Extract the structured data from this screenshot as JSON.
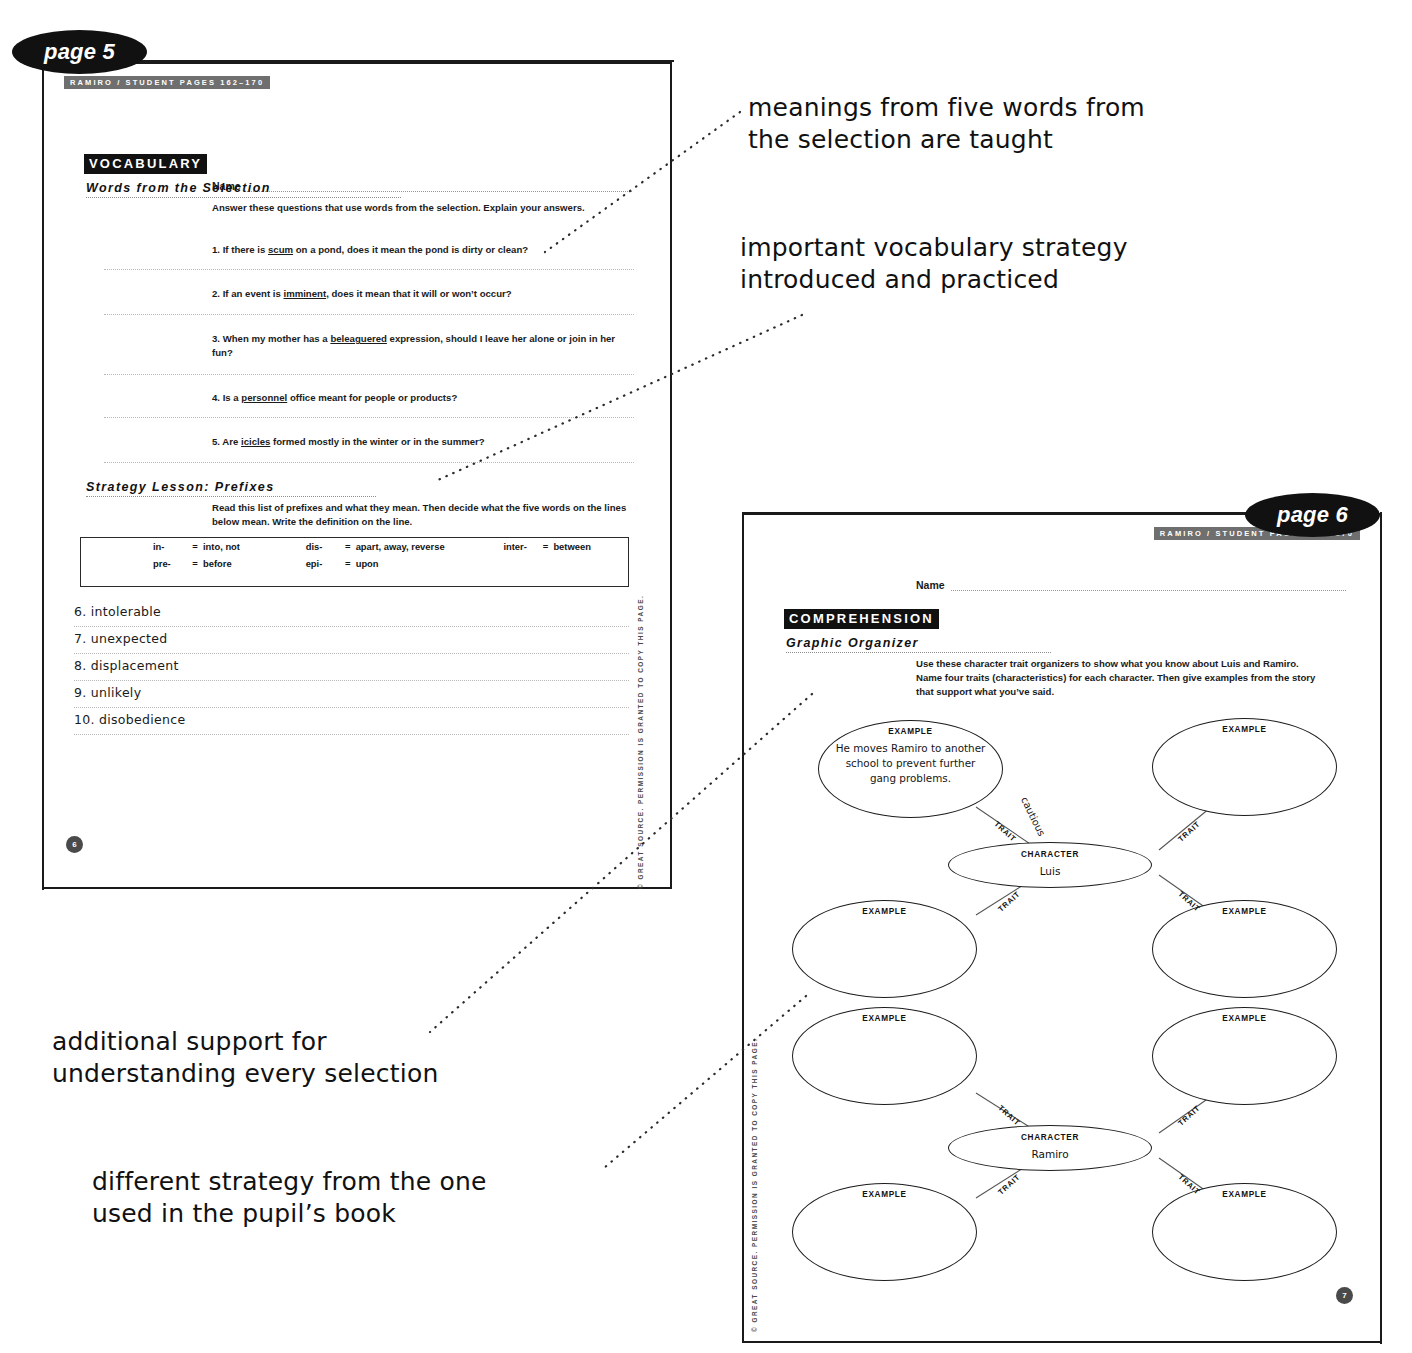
{
  "page5": {
    "tab_label": "page 5",
    "running_head": "RAMIRO / STUDENT PAGES 162–170",
    "name_label": "Name",
    "vocabulary_banner": "VOCABULARY",
    "words_subhead": "Words from the Selection",
    "words_instruction": "Answer these questions that use words from the selection. Explain your answers.",
    "questions": [
      {
        "num": "1.",
        "before": "If there is ",
        "word": "scum",
        "after": " on a pond, does it mean the pond is dirty or clean?"
      },
      {
        "num": "2.",
        "before": "If an event is ",
        "word": "imminent",
        "after": ", does it mean that it will or won’t occur?"
      },
      {
        "num": "3.",
        "before": "When my mother has a ",
        "word": "beleaguered",
        "after": " expression, should I leave her alone or join in her fun?"
      },
      {
        "num": "4.",
        "before": "Is a ",
        "word": "personnel",
        "after": " office meant for people or products?"
      },
      {
        "num": "5.",
        "before": "Are ",
        "word": "icicles",
        "after": " formed mostly in the winter or in the summer?"
      }
    ],
    "strategy_subhead": "Strategy Lesson: Prefixes",
    "strategy_instruction": "Read this list of prefixes and what they mean. Then decide what the five words on the lines below mean. Write the definition on the line.",
    "prefix_table": [
      [
        {
          "prefix": "in-",
          "eq": "=",
          "meaning": "into, not"
        },
        {
          "prefix": "dis-",
          "eq": "=",
          "meaning": "apart, away, reverse"
        },
        {
          "prefix": "inter-",
          "eq": "=",
          "meaning": "between"
        }
      ],
      [
        {
          "prefix": "pre-",
          "eq": "=",
          "meaning": "before"
        },
        {
          "prefix": "epi-",
          "eq": "=",
          "meaning": "upon"
        },
        {
          "prefix": "",
          "eq": "",
          "meaning": ""
        }
      ]
    ],
    "handwritten_words": [
      "6. intolerable",
      "7. unexpected",
      "8. displacement",
      "9. unlikely",
      "10. disobedience"
    ],
    "copyright": "© GREAT SOURCE. PERMISSION IS GRANTED TO COPY THIS PAGE.",
    "page_number": "6"
  },
  "page6": {
    "tab_label": "page 6",
    "running_head": "RAMIRO / STUDENT PAGES 162–170",
    "name_label": "Name",
    "comprehension_banner": "COMPREHENSION",
    "organizer_subhead": "Graphic Organizer",
    "organizer_instruction": "Use these character trait organizers to show what you know about Luis and Ramiro. Name four traits (characteristics) for each character. Then give examples from the story that support what you’ve said.",
    "copyright": "© GREAT SOURCE. PERMISSION IS GRANTED TO COPY THIS PAGE.",
    "page_number": "7",
    "organizers": [
      {
        "character_label": "CHARACTER",
        "character_name": "Luis",
        "trait_label": "TRAIT",
        "example_label": "EXAMPLE",
        "filled_trait": "cautious",
        "filled_example": "He moves Ramiro to another school to prevent further gang problems."
      },
      {
        "character_label": "CHARACTER",
        "character_name": "Ramiro",
        "trait_label": "TRAIT",
        "example_label": "EXAMPLE",
        "filled_trait": "",
        "filled_example": ""
      }
    ]
  },
  "callouts": [
    {
      "id": "callout-vocab-words",
      "text": "meanings from five words from\nthe selection are taught"
    },
    {
      "id": "callout-vocab-strategy",
      "text": "important vocabulary strategy\nintroduced and practiced"
    },
    {
      "id": "callout-support",
      "text": "additional support for\nunderstanding every selection"
    },
    {
      "id": "callout-strategy-diff",
      "text": "different strategy from the one\nused in the pupil’s book"
    }
  ],
  "colors": {
    "ink": "#111111",
    "rule": "#b9b9b9",
    "runhead_bg": "#6f6f6f",
    "banner_bg": "#111111",
    "pagenum_bg": "#4a4a4a"
  }
}
